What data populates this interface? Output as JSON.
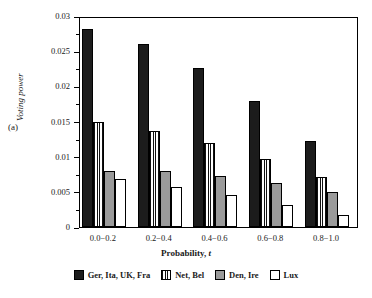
{
  "figure": {
    "panel_label": "(a)"
  },
  "chart_data": {
    "type": "bar",
    "title": "",
    "xlabel_prefix": "Probability, ",
    "xlabel_symbol": "t",
    "ylabel": "Voting power",
    "categories": [
      "0.0−0.2",
      "0.2−0.4",
      "0.4−0.6",
      "0.6−0.8",
      "0.8−1.0"
    ],
    "ylim": [
      0,
      0.03
    ],
    "yticks": [
      0,
      0.005,
      0.01,
      0.015,
      0.02,
      0.025,
      0.03
    ],
    "ytick_labels": [
      "0",
      "0.005",
      "0.01",
      "0.015",
      "0.02",
      "0.025",
      "0.03"
    ],
    "grid": false,
    "legend_position": "bottom",
    "series": [
      {
        "name": "Ger, Ita, UK, Fra",
        "fill": "black",
        "color": "#1c1c1c",
        "values": [
          0.0282,
          0.026,
          0.0226,
          0.0179,
          0.0122
        ]
      },
      {
        "name": "Net, Bel",
        "fill": "striped",
        "color": "#ffffff",
        "values": [
          0.015,
          0.0137,
          0.012,
          0.0097,
          0.0071
        ]
      },
      {
        "name": "Den, Ire",
        "fill": "gray",
        "color": "#9a9a9a",
        "values": [
          0.008,
          0.0079,
          0.0073,
          0.0063,
          0.005
        ]
      },
      {
        "name": "Lux",
        "fill": "white",
        "color": "#ffffff",
        "values": [
          0.0068,
          0.0057,
          0.0046,
          0.0032,
          0.0017
        ]
      }
    ]
  }
}
